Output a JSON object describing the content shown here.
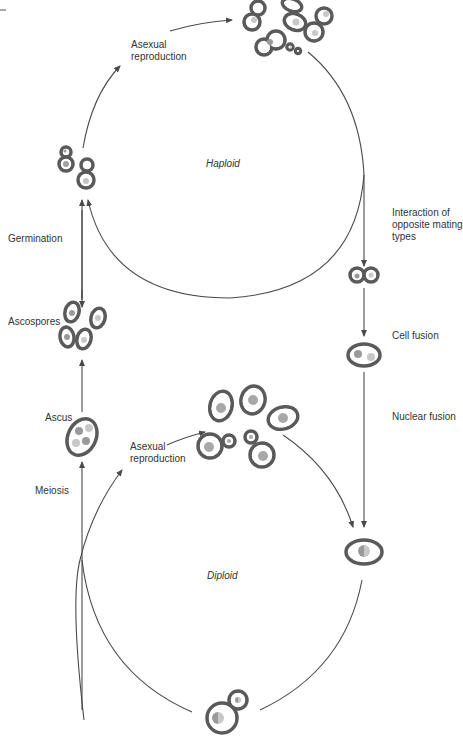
{
  "diagram": {
    "colors": {
      "line": "#4a4a4a",
      "cell_wall": "#5a5a5a",
      "cell_fill": "#ffffff",
      "nucleus_dark": "#9a9a9a",
      "nucleus_light": "#c8c8c8",
      "text": "#333333"
    },
    "phases": {
      "haploid": "Haploid",
      "diploid": "Diploid"
    },
    "labels": {
      "asexual_top": "Asexual\nreproduction",
      "germination": "Germination",
      "ascospores": "Ascospores",
      "ascus": "Ascus",
      "meiosis": "Meiosis",
      "asexual_bottom": "Asexual\nreproduction",
      "interaction": "Interaction of\nopposite mating\ntypes",
      "cell_fusion": "Cell fusion",
      "nuclear_fusion": "Nuclear fusion"
    },
    "stages": [
      {
        "id": "haploid-budding-cells",
        "icon": "budding-haploid-cells"
      },
      {
        "id": "haploid-colony",
        "icon": "haploid-cell-colony"
      },
      {
        "id": "mating-pair",
        "icon": "mating-pair-cells"
      },
      {
        "id": "fused-cell",
        "icon": "fused-cell-two-nuclei"
      },
      {
        "id": "diploid-zygote",
        "icon": "diploid-cell"
      },
      {
        "id": "diploid-budding-cell",
        "icon": "diploid-budding-cell"
      },
      {
        "id": "diploid-colony",
        "icon": "diploid-cell-colony"
      },
      {
        "id": "ascus",
        "icon": "ascus-four-spores"
      },
      {
        "id": "ascospores",
        "icon": "ascospores"
      }
    ]
  }
}
